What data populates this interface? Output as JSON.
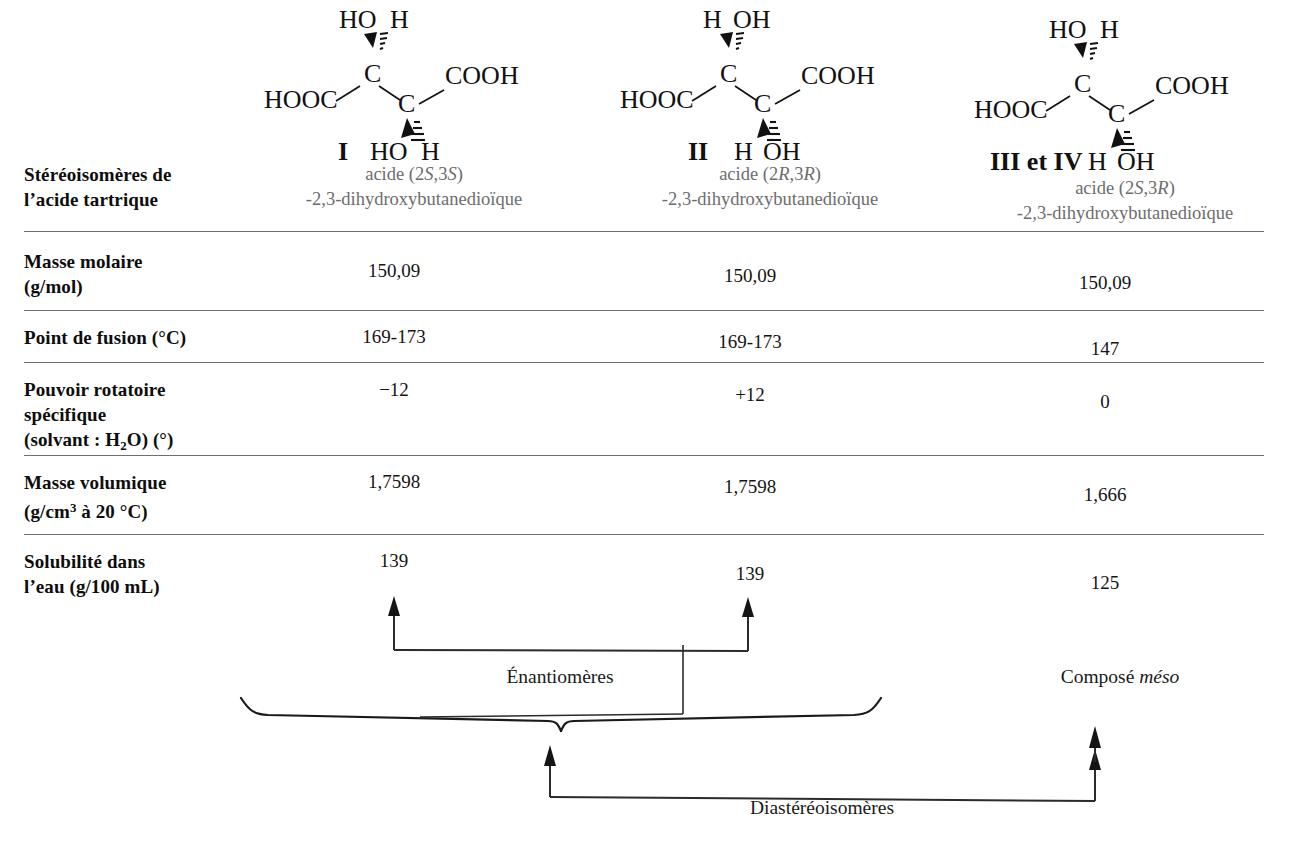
{
  "table": {
    "row_label_header": "Stéréoisomères de\nl’acide tartrique",
    "row_labels": {
      "stereoisomers_l1": "Stéréoisomères de",
      "stereoisomers_l2": "l’acide tartrique",
      "molar_mass_l1": "Masse molaire",
      "molar_mass_l2": "(g/mol)",
      "melting_point": "Point de fusion (°C)",
      "rotation_l1": "Pouvoir rotatoire",
      "rotation_l2": "spécifique",
      "rotation_l3_pre": "(solvant : H",
      "rotation_l3_sub": "2",
      "rotation_l3_post": "O) (°)",
      "density_l1": "Masse volumique",
      "density_l2_pre": "(g/cm",
      "density_l2_sup": "3",
      "density_l2_post": " à 20 °C)",
      "solubility_l1": "Solubilité dans",
      "solubility_l2": "l’eau (g/100 mL)"
    },
    "columns": [
      {
        "roman": "I",
        "name_line1_pre": "acide (2",
        "name_line1_s1": "S",
        "name_line1_mid": ",3",
        "name_line1_s2": "S",
        "name_line1_post": ")",
        "name_line2": "-2,3-dihydroxybutanedioïque",
        "molar_mass": "150,09",
        "melting_point": "169-173",
        "rotation": "−12",
        "density": "1,7598",
        "solubility": "139"
      },
      {
        "roman": "II",
        "name_line1_pre": "acide (2",
        "name_line1_s1": "R",
        "name_line1_mid": ",3",
        "name_line1_s2": "R",
        "name_line1_post": ")",
        "name_line2": "-2,3-dihydroxybutanedioïque",
        "molar_mass": "150,09",
        "melting_point": "169-173",
        "rotation": "+12",
        "density": "1,7598",
        "solubility": "139"
      },
      {
        "roman": "III et IV",
        "name_line1_pre": "acide (2",
        "name_line1_s1": "S",
        "name_line1_mid": ",3",
        "name_line1_s2": "R",
        "name_line1_post": ")",
        "name_line2": "-2,3-dihydroxybutanedioïque",
        "molar_mass": "150,09",
        "melting_point": "147",
        "rotation": "0",
        "density": "1,666",
        "solubility": "125"
      }
    ]
  },
  "molecules": [
    {
      "id": "structure-I",
      "top_left_label": "HO",
      "top_right_label": "H",
      "top_left_bond": "wedge",
      "top_right_bond": "hash",
      "left_group": "HOOC",
      "right_group": "COOH",
      "carbon_upper": "C",
      "carbon_lower": "C",
      "bottom_left_label": "HO",
      "bottom_right_label": "H",
      "bottom_left_bond": "wedge",
      "bottom_right_bond": "hash",
      "roman": "I"
    },
    {
      "id": "structure-II",
      "top_left_label": "H",
      "top_right_label": "OH",
      "top_left_bond": "wedge",
      "top_right_bond": "hash",
      "left_group": "HOOC",
      "right_group": "COOH",
      "carbon_upper": "C",
      "carbon_lower": "C",
      "bottom_left_label": "H",
      "bottom_right_label": "OH",
      "bottom_left_bond": "wedge",
      "bottom_right_bond": "hash",
      "roman": "II"
    },
    {
      "id": "structure-III-IV",
      "top_left_label": "HO",
      "top_right_label": "H",
      "top_left_bond": "wedge",
      "top_right_bond": "hash",
      "left_group": "HOOC",
      "right_group": "COOH",
      "carbon_upper": "C",
      "carbon_lower": "C",
      "bottom_left_label": "H",
      "bottom_right_label": "OH",
      "bottom_left_bond": "wedge",
      "bottom_right_bond": "hash",
      "roman": "III et IV"
    }
  ],
  "annotations": {
    "enantiomers": "Énantiomères",
    "meso_prefix": "Composé ",
    "meso_italic": "méso",
    "diastereomers": "Diastéréoisomères"
  },
  "colors": {
    "rule": "#6f6f6f",
    "text": "#111111",
    "muted_text": "#6d6d6d",
    "annotation_line": "#2b2b2b"
  }
}
